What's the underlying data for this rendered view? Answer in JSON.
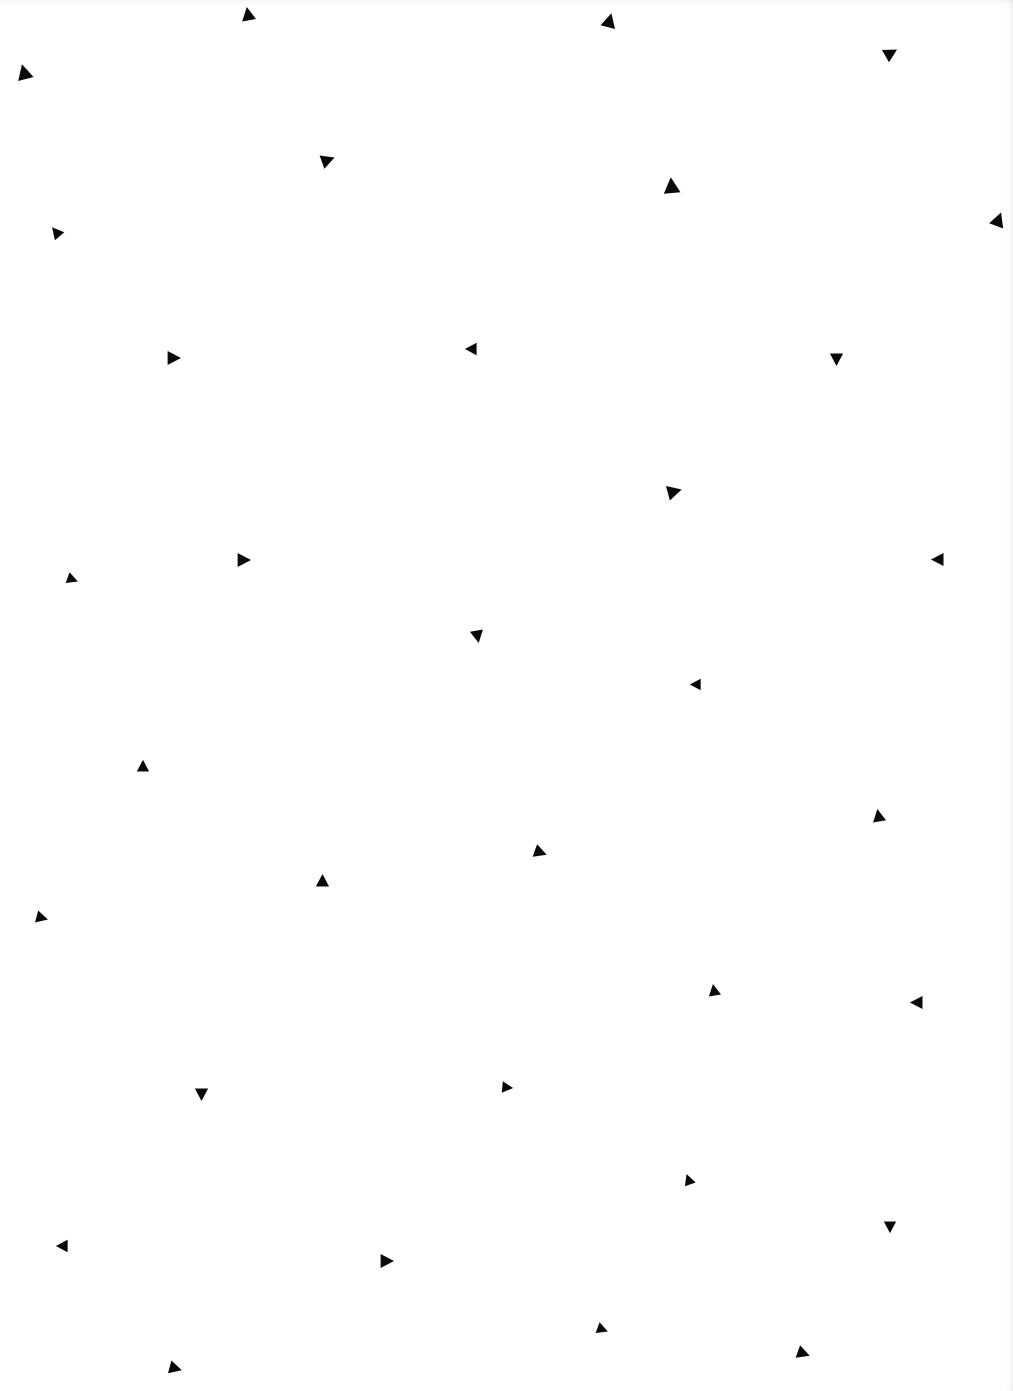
{
  "page": {
    "background": "#ffffff",
    "shape_color": "#0a0a0a"
  },
  "triangles": [
    {
      "x": 248,
      "y": 14,
      "size": 16,
      "angle": -10
    },
    {
      "x": 609,
      "y": 20,
      "size": 17,
      "angle": 15
    },
    {
      "x": 891,
      "y": 53,
      "size": 16,
      "angle": 60
    },
    {
      "x": 24,
      "y": 72,
      "size": 18,
      "angle": -15
    },
    {
      "x": 328,
      "y": 160,
      "size": 16,
      "angle": 70
    },
    {
      "x": 671,
      "y": 185,
      "size": 19,
      "angle": -5
    },
    {
      "x": 998,
      "y": 219,
      "size": 17,
      "angle": 20
    },
    {
      "x": 56,
      "y": 232,
      "size": 14,
      "angle": -40
    },
    {
      "x": 174,
      "y": 358,
      "size": 16,
      "angle": 90
    },
    {
      "x": 471,
      "y": 349,
      "size": 14,
      "angle": -90
    },
    {
      "x": 836,
      "y": 359,
      "size": 15,
      "angle": 180
    },
    {
      "x": 674,
      "y": 491,
      "size": 17,
      "angle": 75
    },
    {
      "x": 244,
      "y": 560,
      "size": 16,
      "angle": 90
    },
    {
      "x": 937,
      "y": 559,
      "size": 15,
      "angle": -90
    },
    {
      "x": 72,
      "y": 579,
      "size": 13,
      "angle": 110
    },
    {
      "x": 477,
      "y": 636,
      "size": 15,
      "angle": 170
    },
    {
      "x": 695,
      "y": 684,
      "size": 13,
      "angle": -90
    },
    {
      "x": 143,
      "y": 766,
      "size": 14,
      "angle": 0
    },
    {
      "x": 878,
      "y": 815,
      "size": 15,
      "angle": -10
    },
    {
      "x": 540,
      "y": 852,
      "size": 15,
      "angle": 110
    },
    {
      "x": 322,
      "y": 880,
      "size": 15,
      "angle": 0
    },
    {
      "x": 42,
      "y": 918,
      "size": 14,
      "angle": 105
    },
    {
      "x": 714,
      "y": 990,
      "size": 14,
      "angle": -10
    },
    {
      "x": 916,
      "y": 1002,
      "size": 15,
      "angle": -90
    },
    {
      "x": 201,
      "y": 1094,
      "size": 15,
      "angle": 180
    },
    {
      "x": 507,
      "y": 1087,
      "size": 13,
      "angle": 95
    },
    {
      "x": 688,
      "y": 1179,
      "size": 13,
      "angle": -20
    },
    {
      "x": 890,
      "y": 1227,
      "size": 14,
      "angle": 180
    },
    {
      "x": 62,
      "y": 1246,
      "size": 14,
      "angle": -90
    },
    {
      "x": 387,
      "y": 1261,
      "size": 16,
      "angle": 90
    },
    {
      "x": 602,
      "y": 1329,
      "size": 13,
      "angle": 110
    },
    {
      "x": 803,
      "y": 1353,
      "size": 15,
      "angle": 110
    },
    {
      "x": 175,
      "y": 1368,
      "size": 15,
      "angle": 105
    }
  ]
}
